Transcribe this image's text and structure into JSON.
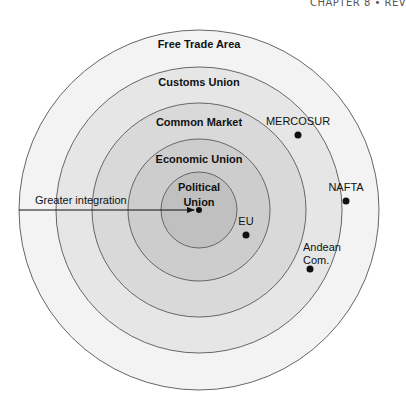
{
  "header": {
    "text": "CHAPTER 8 • REV"
  },
  "diagram": {
    "center": {
      "x": 199,
      "y": 210
    },
    "rings": [
      {
        "name": "Free Trade Area",
        "r": 180,
        "fill": "#f3f3f3",
        "label_y": 48
      },
      {
        "name": "Customs Union",
        "r": 143,
        "fill": "#e6e6e6",
        "label_y": 86
      },
      {
        "name": "Common Market",
        "r": 107,
        "fill": "#d9d9d9",
        "label_y": 126
      },
      {
        "name": "Economic Union",
        "r": 71,
        "fill": "#cdcdcd",
        "label_y": 163
      },
      {
        "name": "Political Union",
        "r": 38,
        "fill": "#c0c0c0",
        "label_lines": [
          "Political",
          "Union"
        ]
      }
    ],
    "arrow": {
      "label": "Greater integration",
      "x1": 19,
      "x2": 194,
      "y": 210
    },
    "points": [
      {
        "label": "MERCOSUR",
        "x": 298,
        "y": 135
      },
      {
        "label": "NAFTA",
        "x": 346,
        "y": 201
      },
      {
        "label": "EU",
        "x": 246,
        "y": 235
      },
      {
        "label": "Andean Com.",
        "lines": [
          "Andean",
          "Com."
        ],
        "x": 310,
        "y": 269
      }
    ],
    "stroke_color": "#666666"
  }
}
